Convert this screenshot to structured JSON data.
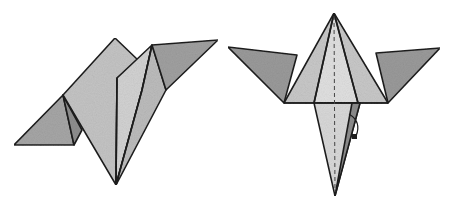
{
  "diagram": {
    "type": "origami-folding-steps",
    "steps": [
      {
        "id": "step-a",
        "description": "Folded paper model viewed at an angle, two pointed flaps rising, tip at bottom",
        "colors": {
          "dark": "#8f8f8f",
          "mid": "#b5b5b5",
          "light": "#d6d6d6",
          "edge": "#1e1e1e"
        }
      },
      {
        "id": "step-b",
        "description": "Front view: central kite with diagonal wings on each side, long point below, valley-fold dashed center line, turn-over arrow",
        "colors": {
          "dark": "#8f8f8f",
          "mid": "#b8b8b8",
          "light": "#dcdcdc",
          "edge": "#1e1e1e"
        }
      }
    ],
    "symbols": [
      "dashed-center-fold-line",
      "curved-fold-arrow"
    ]
  }
}
